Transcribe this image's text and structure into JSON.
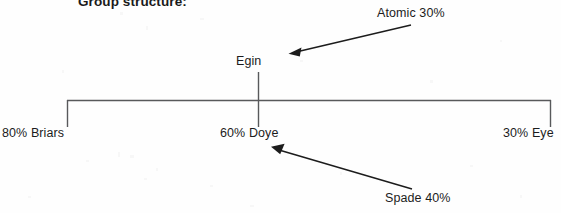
{
  "document": {
    "title": "Group structure:",
    "background_color": "#fefefe",
    "ink_color": "#1c1c1c",
    "line_color": "#58595b"
  },
  "diagram": {
    "type": "org-chart",
    "parent": {
      "name": "Egin",
      "label": "Egin"
    },
    "subsidiaries": [
      {
        "label": "80% Briars",
        "holding": "80%",
        "name": "Briars"
      },
      {
        "label": "60% Doye",
        "holding": "60%",
        "name": "Doye"
      },
      {
        "label": "30% Eye",
        "holding": "30%",
        "name": "Eye"
      }
    ],
    "annotations": [
      {
        "label": "Atomic 30%",
        "name": "Atomic",
        "holding": "30%",
        "points_to": "Egin"
      },
      {
        "label": "Spade 40%",
        "name": "Spade",
        "holding": "40%",
        "points_to": "60% Doye"
      }
    ]
  }
}
